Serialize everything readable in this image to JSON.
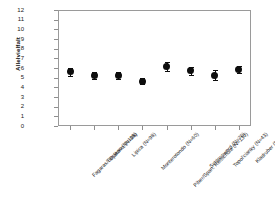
{
  "chart_data": {
    "type": "scatter",
    "title": "",
    "xlabel": "",
    "ylabel": "Allelvielfalt",
    "ylim": [
      0,
      12
    ],
    "yticks": [
      0,
      1,
      2,
      3,
      4,
      5,
      6,
      7,
      8,
      9,
      10,
      11,
      12
    ],
    "grid": false,
    "legend": "none",
    "errorbars": true,
    "marker": "filled-circle",
    "marker_color": "#0d0d0d",
    "categories": [
      "Fagaras/Beclean (N=118)",
      "Djakovo (N=98)",
      "Lipica (N=98)",
      "Monterotondo (N=60)",
      "Piber/Span. Reitschule (N=130)",
      "Schlosswerd (N=76)",
      "Topol'cianky (N=43)",
      "Kladruber (N=47)"
    ],
    "values": [
      5.6,
      5.2,
      5.2,
      4.65,
      6.15,
      5.7,
      5.25,
      5.85
    ],
    "err_low": [
      0.45,
      0.35,
      0.35,
      0.3,
      0.45,
      0.4,
      0.5,
      0.4
    ],
    "err_high": [
      0.45,
      0.35,
      0.35,
      0.3,
      0.45,
      0.4,
      0.5,
      0.4
    ]
  },
  "axis": {
    "y_tick_labels": [
      "12",
      "11",
      "10",
      "9",
      "8",
      "7",
      "6",
      "5",
      "4",
      "3",
      "2",
      "1",
      "0"
    ],
    "y_title": "Allelvielfalt"
  },
  "caption": {
    "stray_text": "",
    "footer_text": ""
  }
}
